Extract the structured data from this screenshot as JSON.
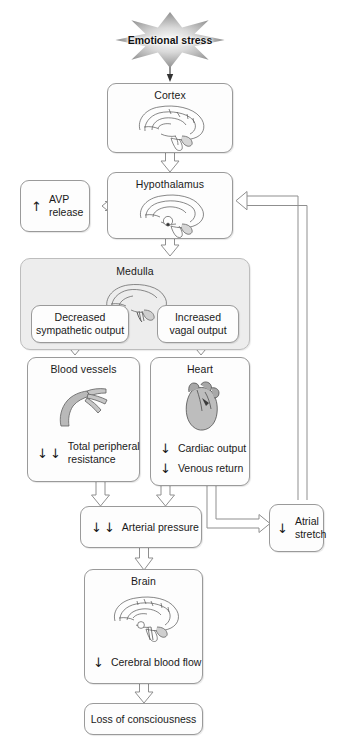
{
  "diagram": {
    "background": "#ffffff",
    "box_fill": "#fdfdfd",
    "box_stroke": "#9a9a9a",
    "group_fill": "#ededed",
    "arrow_stroke": "#8a8a8a"
  },
  "nodes": {
    "stress": {
      "label": "Emotional stress",
      "icon": "starburst-icon"
    },
    "cortex": {
      "title": "Cortex",
      "icon": "brain-sagittal-icon"
    },
    "avp": {
      "arrows": "↑",
      "label_line1": "AVP",
      "label_line2": "release"
    },
    "hypothalamus": {
      "title": "Hypothalamus",
      "icon": "brain-hypothalamus-icon"
    },
    "medulla": {
      "title": "Medulla",
      "icon": "brainstem-medulla-icon"
    },
    "sympathetic": {
      "line1": "Decreased",
      "line2": "sympathetic output"
    },
    "vagal": {
      "line1": "Increased",
      "line2": "vagal output"
    },
    "blood_vessels": {
      "title": "Blood vessels",
      "icon": "blood-vessel-icon",
      "measure": {
        "arrows": "↓↓",
        "text_line1": "Total peripheral",
        "text_line2": "resistance"
      }
    },
    "heart": {
      "title": "Heart",
      "icon": "heart-icon",
      "measures": [
        {
          "arrows": "↓",
          "text": "Cardiac output"
        },
        {
          "arrows": "↓",
          "text": "Venous return"
        }
      ]
    },
    "arterial_pressure": {
      "arrows": "↓↓",
      "text": "Arterial pressure"
    },
    "atrial_stretch": {
      "arrows": "↓",
      "text_line1": "Atrial",
      "text_line2": "stretch"
    },
    "brain": {
      "title": "Brain",
      "icon": "brain-sagittal-icon",
      "measure": {
        "arrows": "↓",
        "text": "Cerebral blood flow"
      }
    },
    "outcome": {
      "label": "Loss of consciousness"
    }
  },
  "edges": [
    {
      "from": "stress",
      "to": "cortex",
      "style": "thin-arrow"
    },
    {
      "from": "cortex",
      "to": "hypothalamus",
      "style": "hollow-arrow"
    },
    {
      "from": "hypothalamus",
      "to": "avp",
      "style": "hollow-arrow-left"
    },
    {
      "from": "hypothalamus",
      "to": "medulla",
      "style": "hollow-arrow"
    },
    {
      "from": "sympathetic",
      "to": "blood_vessels",
      "style": "hollow-arrow"
    },
    {
      "from": "vagal",
      "to": "heart",
      "style": "hollow-arrow"
    },
    {
      "from": "blood_vessels",
      "to": "arterial_pressure",
      "style": "hollow-arrow"
    },
    {
      "from": "heart",
      "to": "arterial_pressure",
      "style": "hollow-arrow"
    },
    {
      "from": "heart",
      "to": "atrial_stretch",
      "style": "hollow-arrow-right"
    },
    {
      "from": "arterial_pressure",
      "to": "brain",
      "style": "hollow-arrow"
    },
    {
      "from": "brain",
      "to": "outcome",
      "style": "hollow-arrow"
    },
    {
      "from": "atrial_stretch",
      "to": "hypothalamus",
      "style": "feedback-line-left"
    }
  ]
}
